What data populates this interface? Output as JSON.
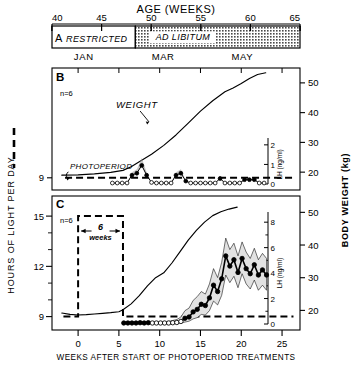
{
  "figure": {
    "top_axis_title": "AGE  (WEEKS)",
    "bottom_axis_title": "WEEKS AFTER START OF PHOTOPERIOD TREATMENTS",
    "left_axis_title": "HOURS OF LIGHT PER DAY",
    "right_axis_title": "BODY WEIGHT  (kg)"
  },
  "age_axis": {
    "ticks": [
      40,
      45,
      50,
      55,
      60,
      65
    ],
    "labels": [
      "40",
      "45",
      "50",
      "55",
      "60",
      "65"
    ],
    "min": 40,
    "max": 65
  },
  "months": {
    "labels": [
      "JAN",
      "MAR",
      "MAY"
    ],
    "age_positions": [
      43.2,
      51.2,
      59.2
    ]
  },
  "panel_a": {
    "letter": "A",
    "segments": [
      {
        "label": "RESTRICTED",
        "start_age": 40,
        "end_age": 48.4,
        "fill": "white"
      },
      {
        "label": "AD LIBITUM",
        "start_age": 48.4,
        "end_age": 65,
        "fill": "hatched"
      }
    ]
  },
  "panel_b": {
    "letter": "B",
    "n_label": "n=6",
    "weight_label": "WEIGHT",
    "photoperiod_label": "PHOTOPERIOD",
    "left_ticks": [
      9
    ],
    "left_tick_labels": [
      "9"
    ],
    "left_min": 8.2,
    "left_max": 16.2,
    "lh_ticks": [
      0,
      1,
      2
    ],
    "lh_tick_labels": [
      "0",
      "1",
      "2"
    ],
    "lh_min": 0,
    "lh_max": 2.35,
    "bw_ticks": [
      20,
      30,
      40,
      50
    ],
    "bw_tick_labels": [
      "20",
      "30",
      "40",
      "50"
    ],
    "bw_min": 14,
    "bw_max": 55,
    "photoperiod_hours": 9,
    "weight_series": {
      "x": [
        -2.0,
        0,
        2,
        4,
        5.5,
        6.5,
        7.5,
        9,
        10.5,
        12,
        13.5,
        15,
        16.5,
        18,
        19,
        20,
        21,
        22,
        23
      ],
      "y": [
        19.0,
        19.1,
        19.4,
        19.9,
        20.6,
        21.8,
        23.5,
        26.0,
        29.0,
        32.5,
        36.5,
        40.5,
        44.0,
        47.0,
        48.3,
        49.8,
        51.5,
        52.8,
        53.4
      ]
    },
    "lh_series": {
      "x": [
        4.2,
        4.8,
        5.4,
        6.0,
        6.6,
        7.2,
        7.8,
        8.4,
        9.0,
        9.6,
        10.2,
        10.8,
        11.4,
        12.0,
        12.6,
        13.2,
        13.8,
        14.4,
        15.0,
        15.6,
        16.2,
        16.8,
        17.4,
        18.0,
        18.6,
        19.2,
        19.8,
        20.4,
        21.0,
        21.6,
        22.2,
        22.8
      ],
      "y": [
        0.05,
        0.05,
        0.05,
        0.05,
        0.45,
        0.55,
        0.95,
        0.45,
        0.08,
        0.05,
        0.05,
        0.05,
        0.05,
        0.45,
        0.55,
        0.15,
        0.05,
        0.05,
        0.05,
        0.05,
        0.05,
        0.05,
        0.28,
        0.05,
        0.05,
        0.05,
        0.05,
        0.22,
        0.22,
        0.22,
        0.05,
        0.05
      ],
      "filled": [
        false,
        false,
        false,
        false,
        true,
        true,
        true,
        true,
        false,
        false,
        false,
        false,
        false,
        true,
        true,
        true,
        false,
        false,
        false,
        false,
        false,
        false,
        true,
        false,
        false,
        false,
        false,
        true,
        true,
        true,
        false,
        false
      ]
    }
  },
  "panel_c": {
    "letter": "C",
    "n_label": "n=6",
    "weeks_label": "6",
    "weeks_sub_label": "weeks",
    "left_ticks": [
      9,
      12,
      15
    ],
    "left_tick_labels": [
      "9",
      "12",
      "15"
    ],
    "left_min": 8.2,
    "left_max": 16.2,
    "lh_ticks": [
      0,
      2,
      4,
      6,
      8
    ],
    "lh_tick_labels": [
      "0",
      "2",
      "4",
      "6",
      "8"
    ],
    "lh_min": 0,
    "lh_max": 8.8,
    "bw_ticks": [
      20,
      30,
      40,
      50
    ],
    "bw_tick_labels": [
      "20",
      "30",
      "40",
      "50"
    ],
    "bw_min": 14,
    "bw_max": 55,
    "photoperiod_long_hours": 15,
    "photoperiod_short_hours": 9,
    "photoperiod_step_start": 0,
    "photoperiod_step_end": 5.5,
    "weight_series": {
      "x": [
        -2.0,
        -1.0,
        0,
        1,
        2,
        3,
        4,
        5,
        5.5,
        6.5,
        7.5,
        8.5,
        9.5,
        10.5,
        11.5,
        12.5,
        13.5,
        14.5,
        15.5,
        16.5,
        17.5,
        18.5,
        19.5
      ],
      "y": [
        19.2,
        18.8,
        18.6,
        18.7,
        18.9,
        19.1,
        19.3,
        19.6,
        20.2,
        22.0,
        24.5,
        27.5,
        30.0,
        31.5,
        34.5,
        38.0,
        41.5,
        44.5,
        47.0,
        49.0,
        50.2,
        51.0,
        51.6
      ]
    },
    "lh_series": {
      "x": [
        5.6,
        6.1,
        6.6,
        7.1,
        7.6,
        8.1,
        8.6,
        9.1,
        9.6,
        10.1,
        10.6,
        11.1,
        11.6,
        12.1,
        12.6,
        13.1,
        13.6,
        14.1,
        14.6,
        15.1,
        15.6,
        16.1,
        16.6,
        17.1,
        17.6,
        18.1,
        18.6,
        19.1
      ],
      "mean": [
        0.08,
        0.08,
        0.08,
        0.08,
        0.1,
        0.08,
        0.1,
        0.08,
        0.08,
        0.08,
        0.08,
        0.08,
        0.1,
        0.12,
        0.2,
        0.45,
        0.55,
        0.95,
        1.15,
        1.55,
        1.45,
        2.05,
        3.05,
        2.55,
        3.55,
        5.35,
        4.55,
        5.05
      ],
      "upper": [
        0.18,
        0.18,
        0.18,
        0.18,
        0.22,
        0.18,
        0.22,
        0.18,
        0.18,
        0.18,
        0.18,
        0.2,
        0.28,
        0.35,
        0.55,
        1.05,
        1.25,
        1.85,
        2.15,
        2.55,
        2.35,
        3.15,
        4.35,
        3.65,
        4.85,
        6.75,
        5.85,
        6.35
      ],
      "lower": [
        0.02,
        0.02,
        0.02,
        0.02,
        0.03,
        0.02,
        0.03,
        0.02,
        0.02,
        0.02,
        0.02,
        0.02,
        0.03,
        0.05,
        0.08,
        0.15,
        0.22,
        0.4,
        0.5,
        0.75,
        0.7,
        1.05,
        1.8,
        1.5,
        2.25,
        3.85,
        3.25,
        3.75
      ],
      "filled": [
        true,
        true,
        true,
        true,
        true,
        true,
        true,
        false,
        false,
        false,
        false,
        false,
        false,
        false,
        false,
        true,
        true,
        true,
        true,
        true,
        true,
        true,
        true,
        true,
        true,
        true,
        true,
        true
      ]
    },
    "lh_series_tail": {
      "x": [
        19.6,
        20.1,
        20.6,
        21.1,
        21.6,
        22.1,
        22.6,
        23.1
      ],
      "mean": [
        4.05,
        5.15,
        4.35,
        3.95,
        4.65,
        3.85,
        4.25,
        3.85
      ],
      "upper": [
        5.35,
        6.45,
        5.65,
        5.15,
        5.95,
        5.05,
        5.55,
        5.15
      ],
      "lower": [
        2.85,
        3.95,
        3.15,
        2.75,
        3.45,
        2.65,
        3.05,
        2.65
      ],
      "filled": [
        true,
        true,
        true,
        true,
        true,
        true,
        true,
        true
      ]
    }
  },
  "x_axis": {
    "ticks": [
      0,
      5,
      10,
      15,
      20,
      25
    ],
    "labels": [
      "0",
      "5",
      "10",
      "15",
      "20",
      "25"
    ],
    "min": -3.2,
    "max": 27.2
  },
  "colors": {
    "ink": "#000000",
    "band_fill": "#e2e2e2",
    "hatch": "#4a4a4a"
  }
}
